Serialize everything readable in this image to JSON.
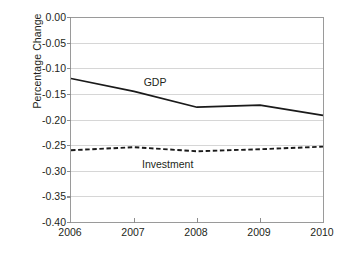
{
  "chart_data": {
    "type": "line",
    "title": "",
    "xlabel": "",
    "ylabel": "Percentage Change",
    "x": [
      2006,
      2007,
      2008,
      2009,
      2010
    ],
    "categories": [
      "2006",
      "2007",
      "2008",
      "2009",
      "2010"
    ],
    "xlim": [
      2006,
      2010
    ],
    "ylim": [
      -0.4,
      0.0
    ],
    "ytick_values": [
      0.0,
      -0.05,
      -0.1,
      -0.15,
      -0.2,
      -0.25,
      -0.3,
      -0.35,
      -0.4
    ],
    "ytick_labels": [
      "0.00",
      "-0.05",
      "-0.10",
      "-0.15",
      "-0.20",
      "-0.25",
      "-0.30",
      "-0.35",
      "-0.40"
    ],
    "xtick_labels": [
      "2006",
      "2007",
      "2008",
      "2009",
      "2010"
    ],
    "grid": "horizontal",
    "legend": "inline-labels",
    "series": [
      {
        "name": "GDP",
        "style": "solid",
        "color": "#1a1a1a",
        "values": [
          -0.12,
          -0.145,
          -0.176,
          -0.172,
          -0.192
        ],
        "label_x": 2007.35,
        "label_y": -0.128
      },
      {
        "name": "Investment",
        "style": "dashed",
        "color": "#1a1a1a",
        "values": [
          -0.26,
          -0.254,
          -0.262,
          -0.258,
          -0.253
        ],
        "label_x": 2007.55,
        "label_y": -0.288
      }
    ],
    "annotations": []
  },
  "colors": {
    "background": "#ffffff",
    "gridline": "#d6d6d6",
    "axis": "#9a9a9a",
    "text": "#231f20",
    "series_line": "#1a1a1a"
  }
}
